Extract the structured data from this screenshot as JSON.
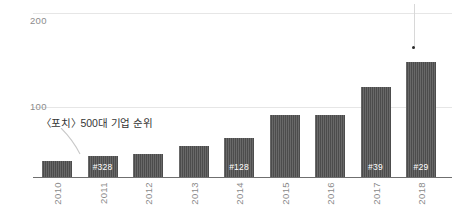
{
  "chart_data": {
    "type": "bar",
    "title": "",
    "subtitle": "",
    "xlabel": "",
    "ylabel": "",
    "categories": [
      "2010",
      "2011",
      "2012",
      "2013",
      "2014",
      "2015",
      "2016",
      "2017",
      "2018"
    ],
    "values": [
      23,
      30,
      33,
      44,
      56,
      88,
      88,
      128,
      165
    ],
    "ylim": [
      0,
      210
    ],
    "yticks": [
      100,
      200
    ],
    "ytick_labels": [
      "100",
      "200"
    ],
    "grid": true,
    "legend": null,
    "bar_color": "#4c4c4c",
    "gridline_color": "#e6e6e6",
    "axis_color": "#6f6f6f",
    "tick_label_color": "#8a8a8a",
    "data_labels": [
      {
        "category": "2011",
        "text": "#328"
      },
      {
        "category": "2014",
        "text": "#128"
      },
      {
        "category": "2017",
        "text": "#39"
      },
      {
        "category": "2018",
        "text": "#29"
      }
    ],
    "annotations": [
      {
        "text": "《포치》500대 기업 순위",
        "points_to": "2011"
      }
    ]
  },
  "yaxis": {
    "tick_200": "200",
    "tick_100": "100"
  },
  "xaxis": {
    "labels": [
      "2010",
      "2011",
      "2012",
      "2013",
      "2014",
      "2015",
      "2016",
      "2017",
      "2018"
    ]
  },
  "bars": [
    {
      "year": "2010",
      "value": 23,
      "label": ""
    },
    {
      "year": "2011",
      "value": 30,
      "label": "#328"
    },
    {
      "year": "2012",
      "value": 33,
      "label": ""
    },
    {
      "year": "2013",
      "value": 44,
      "label": ""
    },
    {
      "year": "2014",
      "value": 56,
      "label": "#128"
    },
    {
      "year": "2015",
      "value": 88,
      "label": ""
    },
    {
      "year": "2016",
      "value": 88,
      "label": ""
    },
    {
      "year": "2017",
      "value": 128,
      "label": "#39"
    },
    {
      "year": "2018",
      "value": 165,
      "label": "#29"
    }
  ],
  "annotation": {
    "text": "〈포치〉500대 기업 순위"
  }
}
